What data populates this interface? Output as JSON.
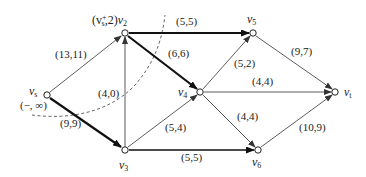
{
  "graph": {
    "type": "flow-network",
    "nodes": [
      {
        "id": "vs",
        "label": "v",
        "sub": "s",
        "x": 47,
        "y": 95,
        "extra_label": "(−, ∞)"
      },
      {
        "id": "v2",
        "label": "v",
        "sub": "2",
        "x": 125,
        "y": 33,
        "prefix_label": "(v",
        "prefix_sub": "s",
        "prefix_sup": "+",
        "prefix_rest": ",2)"
      },
      {
        "id": "v3",
        "label": "v",
        "sub": "3",
        "x": 125,
        "y": 150
      },
      {
        "id": "v4",
        "label": "v",
        "sub": "4",
        "x": 200,
        "y": 92
      },
      {
        "id": "v5",
        "label": "v",
        "sub": "5",
        "x": 253,
        "y": 33
      },
      {
        "id": "vt",
        "label": "v",
        "sub": "t",
        "x": 335,
        "y": 92
      },
      {
        "id": "v6",
        "label": "v",
        "sub": "6",
        "x": 258,
        "y": 150
      }
    ],
    "edges": [
      {
        "from": "vs",
        "to": "v2",
        "label": "(13,11)",
        "bold": false
      },
      {
        "from": "vs",
        "to": "v3",
        "label": "(9,9)",
        "bold": true
      },
      {
        "from": "v3",
        "to": "v2",
        "label": "(4,0)",
        "bold": false
      },
      {
        "from": "v2",
        "to": "v5",
        "label": "(5,5)",
        "bold": true
      },
      {
        "from": "v2",
        "to": "v4",
        "label": "(6,6)",
        "bold": true
      },
      {
        "from": "v3",
        "to": "v4",
        "label": "(5,4)",
        "bold": false
      },
      {
        "from": "v3",
        "to": "v6",
        "label": "(5,5)",
        "bold": true
      },
      {
        "from": "v4",
        "to": "v5",
        "label": "(5,2)",
        "bold": false
      },
      {
        "from": "v4",
        "to": "vt",
        "label": "(4,4)",
        "bold": false
      },
      {
        "from": "v4",
        "to": "v6",
        "label": "(4,4)",
        "bold": false
      },
      {
        "from": "v5",
        "to": "vt",
        "label": "(9,7)",
        "bold": false
      },
      {
        "from": "v6",
        "to": "vt",
        "label": "(10,9)",
        "bold": false
      }
    ],
    "cut": {
      "style": "dashed",
      "description": "cut curve separating vs, v2 side"
    }
  },
  "labels": {
    "vs_main": "v",
    "vs_sub": "s",
    "vs_extra": "(−, ∞)",
    "v2_prefix": "(v",
    "v2_prefix_sub": "s",
    "v2_prefix_sup": "+",
    "v2_prefix_rest": ",2)",
    "v2_main": "v",
    "v2_sub": "2",
    "v3_main": "v",
    "v3_sub": "3",
    "v4_main": "v",
    "v4_sub": "4",
    "v5_main": "v",
    "v5_sub": "5",
    "vt_main": "v",
    "vt_sub": "t",
    "v6_main": "v",
    "v6_sub": "6",
    "e_vs_v2": "(13,11)",
    "e_vs_v3": "(9,9)",
    "e_v3_v2": "(4,0)",
    "e_v2_v5": "(5,5)",
    "e_v2_v4": "(6,6)",
    "e_v3_v4": "(5,4)",
    "e_v3_v6": "(5,5)",
    "e_v4_v5": "(5,2)",
    "e_v4_vt": "(4,4)",
    "e_v4_v6": "(4,4)",
    "e_v5_vt": "(9,7)",
    "e_v6_vt": "(10,9)"
  },
  "colors": {
    "stroke": "#333333",
    "bold_stroke": "#111111",
    "dashed": "#555555",
    "background": "#ffffff"
  }
}
